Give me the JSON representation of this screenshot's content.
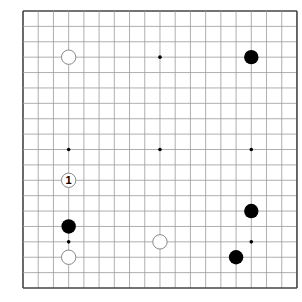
{
  "board": {
    "size": 19,
    "origin_x": 23,
    "origin_y": 11,
    "spacing_x": 15.22,
    "spacing_y": 15.39,
    "line_color": "#9a9a9a",
    "border_color": "#444444",
    "stone_black": "#000000",
    "stone_white_fill": "#ffffff",
    "stone_white_stroke": "#888888"
  },
  "star_points": [
    [
      3,
      3
    ],
    [
      9,
      3
    ],
    [
      15,
      3
    ],
    [
      3,
      9
    ],
    [
      9,
      9
    ],
    [
      15,
      9
    ],
    [
      3,
      15
    ],
    [
      9,
      15
    ],
    [
      15,
      15
    ]
  ],
  "stones": [
    {
      "col": 3,
      "row": 3,
      "color": "white",
      "label": ""
    },
    {
      "col": 15,
      "row": 3,
      "color": "black",
      "label": ""
    },
    {
      "col": 3,
      "row": 11,
      "color": "white",
      "label": "1"
    },
    {
      "col": 3,
      "row": 14,
      "color": "black",
      "label": ""
    },
    {
      "col": 3,
      "row": 16,
      "color": "white",
      "label": ""
    },
    {
      "col": 9,
      "row": 15,
      "color": "white",
      "label": ""
    },
    {
      "col": 15,
      "row": 13,
      "color": "black",
      "label": ""
    },
    {
      "col": 14,
      "row": 16,
      "color": "black",
      "label": ""
    }
  ]
}
